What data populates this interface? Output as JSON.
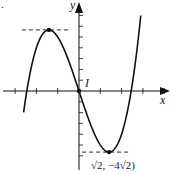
{
  "chart_data": {
    "type": "line",
    "function": "y = x^3 - 6x",
    "title": "",
    "panel_marker": ".",
    "xlabel": "x",
    "ylabel": "y",
    "xlim": [
      -3.5,
      4.3
    ],
    "ylim": [
      -6.5,
      7.5
    ],
    "x_tick_step": 1,
    "y_tick_step": 1,
    "grid": false,
    "series": [
      {
        "name": "curve",
        "x_range": [
          -2.6,
          2.9
        ]
      }
    ],
    "points": [
      {
        "name": "local-max",
        "x": -1.4142,
        "y": 5.6569,
        "dashed_guide": true
      },
      {
        "name": "inflection",
        "x": 0,
        "y": 0,
        "label": "I"
      },
      {
        "name": "local-min",
        "x": 1.4142,
        "y": -5.6569,
        "dashed_guide": true,
        "label": "(√2, −4√2)"
      }
    ],
    "annotations": [
      "I",
      "√2, −4√2)"
    ]
  }
}
